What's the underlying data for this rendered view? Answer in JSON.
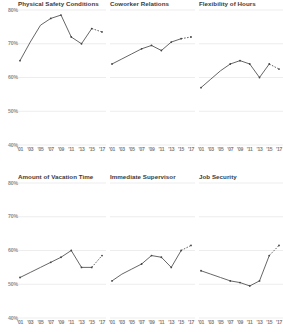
{
  "figure": {
    "kind": "small-multiples-line-grid",
    "rows": 2,
    "cols": 3,
    "line_color": "#555555",
    "marker_color": "#444444",
    "grid_color": "#e8e8e8",
    "axis_text_color": "#8c8c8c",
    "title_color": "#3a3a3a",
    "background": "#ffffff"
  },
  "axis": {
    "y_ticks": [
      "80%",
      "70%",
      "60%",
      "50%",
      "40%"
    ],
    "y_values": [
      80,
      70,
      60,
      50,
      40
    ],
    "ylim": [
      40,
      80
    ],
    "x_ticks": [
      "'01",
      "'03",
      "'05",
      "'07",
      "'09",
      "'11",
      "'13",
      "'15",
      "'17"
    ],
    "x_values": [
      2001,
      2003,
      2005,
      2007,
      2009,
      2011,
      2013,
      2015,
      2017
    ],
    "grid": true,
    "legend": "none"
  },
  "chart_data": [
    {
      "type": "line",
      "title": "Physical Safety Conditions",
      "xlabel": "",
      "ylabel": "",
      "ylim": [
        40,
        80
      ],
      "categories": [
        "'01",
        "'03",
        "'05",
        "'07",
        "'09",
        "'11",
        "'13",
        "'15",
        "'17"
      ],
      "values": [
        65,
        70.5,
        75.5,
        77.5,
        78.5,
        72,
        70,
        74.5,
        73.5
      ],
      "dashed_from_index": 7
    },
    {
      "type": "line",
      "title": "Coworker Relations",
      "xlabel": "",
      "ylabel": "",
      "ylim": [
        40,
        80
      ],
      "categories": [
        "'01",
        "'03",
        "'05",
        "'07",
        "'09",
        "'11",
        "'13",
        "'15",
        "'17"
      ],
      "values": [
        64,
        65.5,
        67,
        68.5,
        69.5,
        68,
        70.5,
        71.5,
        72
      ],
      "dashed_from_index": 7
    },
    {
      "type": "line",
      "title": "Flexibility of Hours",
      "xlabel": "",
      "ylabel": "",
      "ylim": [
        40,
        80
      ],
      "categories": [
        "'01",
        "'03",
        "'05",
        "'07",
        "'09",
        "'11",
        "'13",
        "'15",
        "'17"
      ],
      "values": [
        57,
        59.5,
        62,
        64,
        65,
        64,
        60,
        64,
        62.5
      ],
      "dashed_from_index": 7
    },
    {
      "type": "line",
      "title": "Amount of Vacation Time",
      "xlabel": "",
      "ylabel": "",
      "ylim": [
        40,
        80
      ],
      "categories": [
        "'01",
        "'03",
        "'05",
        "'07",
        "'09",
        "'11",
        "'13",
        "'15",
        "'17"
      ],
      "values": [
        52,
        53.5,
        55,
        56.5,
        58,
        60,
        55,
        55,
        58.5
      ],
      "dashed_from_index": 7
    },
    {
      "type": "line",
      "title": "Immediate Supervisor",
      "xlabel": "",
      "ylabel": "",
      "ylim": [
        40,
        80
      ],
      "categories": [
        "'01",
        "'03",
        "'05",
        "'07",
        "'09",
        "'11",
        "'13",
        "'15",
        "'17"
      ],
      "values": [
        51,
        53,
        54.5,
        56,
        58.5,
        58,
        55,
        60,
        61.5
      ],
      "dashed_from_index": 7
    },
    {
      "type": "line",
      "title": "Job Security",
      "xlabel": "",
      "ylabel": "",
      "ylim": [
        40,
        80
      ],
      "categories": [
        "'01",
        "'03",
        "'05",
        "'07",
        "'09",
        "'11",
        "'13",
        "'15",
        "'17"
      ],
      "values": [
        54,
        53,
        52,
        51,
        50.5,
        49.5,
        51,
        58.5,
        61.5
      ],
      "dashed_from_index": 7
    }
  ]
}
